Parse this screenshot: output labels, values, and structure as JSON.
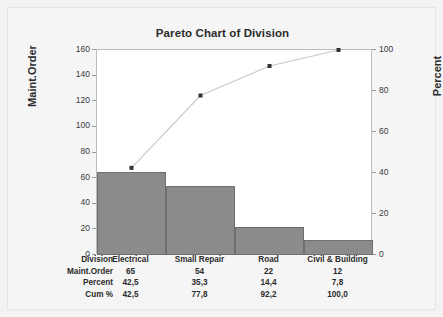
{
  "chart_data": {
    "type": "bar",
    "title": "Pareto Chart of Division",
    "categories": [
      "Electrical",
      "Small Repair",
      "Road",
      "Civil & Building"
    ],
    "values": [
      65,
      54,
      22,
      12
    ],
    "series": [
      {
        "name": "Maint.Order",
        "values": [
          65,
          54,
          22,
          12
        ]
      },
      {
        "name": "Cum %",
        "values": [
          42.5,
          77.8,
          92.2,
          100.0
        ]
      }
    ],
    "percent": [
      42.5,
      35.3,
      14.4,
      7.8
    ],
    "cum_percent": [
      42.5,
      77.8,
      92.2,
      100.0
    ],
    "xlabel": "",
    "ylabel": "Maint.Order",
    "y2label": "Percent",
    "ylim": [
      0,
      160
    ],
    "y2lim": [
      0,
      100
    ],
    "yticks": [
      0,
      20,
      40,
      60,
      80,
      100,
      120,
      140,
      160
    ],
    "y2ticks": [
      0,
      20,
      40,
      60,
      80,
      100
    ],
    "grid": false,
    "legend": "none",
    "bar_color": "#8b8b8b",
    "line_color": "#c9c9c9",
    "marker_color": "#333333"
  },
  "axes": {
    "left_title": "Maint.Order",
    "right_title": "Percent",
    "left_ticks": [
      "160",
      "140",
      "120",
      "100",
      "80",
      "60",
      "40",
      "20",
      "0"
    ],
    "right_ticks": [
      "100",
      "80",
      "60",
      "40",
      "20",
      "0"
    ]
  },
  "table": {
    "rows": [
      {
        "label": "Division",
        "cells": [
          "Electrical",
          "Small Repair",
          "Road",
          "Civil & Building"
        ]
      },
      {
        "label": "Maint.Order",
        "cells": [
          "65",
          "54",
          "22",
          "12"
        ]
      },
      {
        "label": "Percent",
        "cells": [
          "42,5",
          "35,3",
          "14,4",
          "7,8"
        ]
      },
      {
        "label": "Cum %",
        "cells": [
          "42,5",
          "77,8",
          "92,2",
          "100,0"
        ]
      }
    ]
  }
}
